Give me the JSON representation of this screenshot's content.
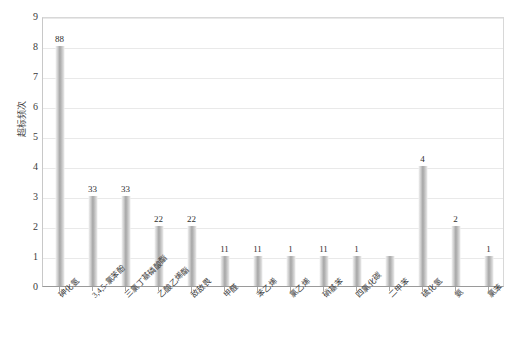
{
  "chart_data": {
    "type": "bar",
    "title": "",
    "xlabel": "",
    "ylabel": "超标频次",
    "ylim": [
      0,
      9
    ],
    "yticks": [
      0,
      1,
      2,
      3,
      4,
      5,
      6,
      7,
      8,
      9
    ],
    "grid": true,
    "legend": false,
    "categories": [
      "砷化氢",
      "3,4,5-氯苯酚",
      "三氯丁基磷酸酯",
      "乙酸乙烯酯",
      "敌敌畏",
      "甲醛",
      "苯乙烯",
      "氯乙烯",
      "硝基苯",
      "四氯化碳",
      "二甲苯",
      "硫化氢",
      "氨",
      "氯苯"
    ],
    "category_labels_display": [
      "砷化氢",
      "3,4,5-氯苯酚",
      "三氯丁基磷酸酯",
      "乙酸乙烯酯",
      "敌敌畏",
      "甲醛",
      "苯乙烯",
      "氯乙烯",
      "硝基苯",
      "四氯化碳",
      "二甲苯",
      "硫化氢",
      "氨",
      "氯苯"
    ],
    "values": [
      8,
      3,
      3,
      2,
      2,
      1,
      1,
      1,
      1,
      1,
      1,
      4,
      2,
      1
    ],
    "data_labels": [
      "88",
      "33",
      "33",
      "22",
      "22",
      "11",
      "11",
      "1",
      "11",
      "1",
      "",
      "4",
      "2",
      "1"
    ],
    "bar_color_light": "#f2f2f2",
    "bar_color_mid": "#a6a6a6",
    "axis_color": "#9a9a9a",
    "grid_color": "#e9e9e9"
  }
}
